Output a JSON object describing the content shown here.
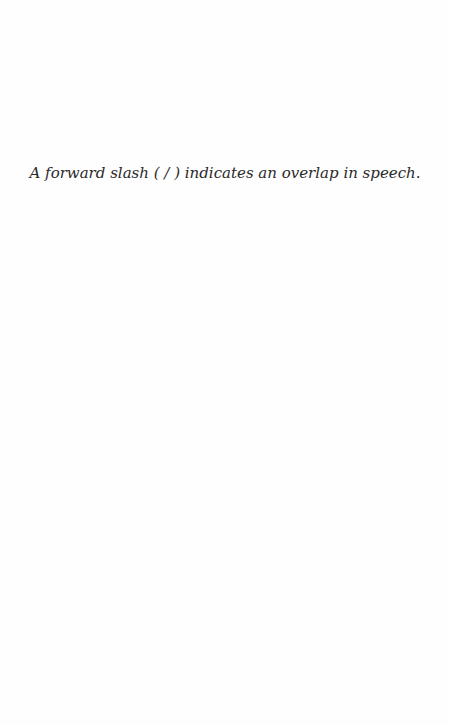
{
  "page": {
    "note": "A forward slash ( / ) indicates an overlap in speech."
  }
}
